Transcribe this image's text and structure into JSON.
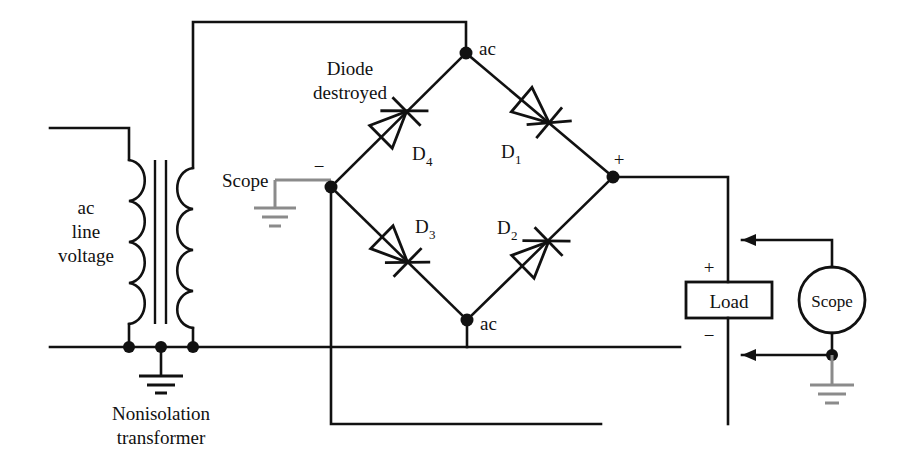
{
  "figure": {
    "type": "circuit-schematic"
  },
  "labels": {
    "ac_line_voltage_line1": "ac",
    "ac_line_voltage_line2": "line",
    "ac_line_voltage_line3": "voltage",
    "nonisolation_line1": "Nonisolation",
    "nonisolation_line2": "transformer",
    "diode_destroyed_line1": "Diode",
    "diode_destroyed_line2": "destroyed",
    "scope_left": "Scope",
    "scope_right": "Scope",
    "load": "Load",
    "ac_top": "ac",
    "ac_bottom": "ac",
    "bridge_minus": "−",
    "bridge_plus": "+",
    "load_plus": "+",
    "load_minus": "−",
    "scope_minus": "−"
  },
  "diodes": [
    {
      "id": "D1",
      "base": "D",
      "sub": "1",
      "destroyed": false,
      "direction": "down-right",
      "position": "upper-right"
    },
    {
      "id": "D2",
      "base": "D",
      "sub": "2",
      "destroyed": false,
      "direction": "up-right",
      "position": "lower-right"
    },
    {
      "id": "D3",
      "base": "D",
      "sub": "3",
      "destroyed": false,
      "direction": "down-right",
      "position": "lower-left"
    },
    {
      "id": "D4",
      "base": "D",
      "sub": "4",
      "destroyed": true,
      "direction": "up-right",
      "position": "upper-left"
    }
  ],
  "nodes": {
    "ac_top": {
      "x": 466,
      "y": 53
    },
    "ac_bottom": {
      "x": 467,
      "y": 320
    },
    "dc_minus": {
      "x": 331,
      "y": 187
    },
    "dc_plus": {
      "x": 613,
      "y": 177
    }
  },
  "colors": {
    "wire": "#111111",
    "ground_scope": "#8b8b8b",
    "ground_earth": "#111111",
    "background": "#ffffff",
    "text": "#111111"
  },
  "components": {
    "transformer": {
      "name": "nonisolation-transformer",
      "turns_per_winding": 4
    },
    "load": {
      "name": "load-resistor",
      "shape": "rectangle"
    },
    "scope_left": {
      "name": "scope-probe-left",
      "shape": "ground-symbol"
    },
    "scope_right": {
      "name": "scope-instrument-right",
      "shape": "circle"
    }
  }
}
